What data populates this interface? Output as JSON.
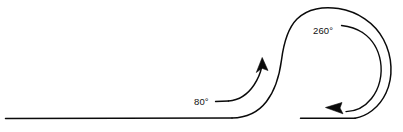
{
  "diagram": {
    "background_color": "#ffffff",
    "stroke_color": "#0a0a0a",
    "labels": {
      "entry_angle": "80°",
      "loop_angle": "260°"
    },
    "elements": {
      "baseline_name": "baseline",
      "main_curve_name": "main-loop-curve",
      "tail_name": "exit-tail-line",
      "entry_arrow_name": "entry-angle-arrow",
      "loop_arrow_name": "loop-angle-arrow"
    }
  }
}
